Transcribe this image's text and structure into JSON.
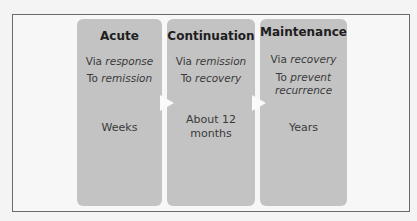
{
  "phases": [
    {
      "title": "Acute",
      "via_prefix": "Via ",
      "via_em": "response",
      "to_prefix": "To ",
      "to_em": "remission",
      "to_em2": "",
      "duration": "Weeks"
    },
    {
      "title": "Continuation",
      "via_prefix": "Via ",
      "via_em": "remission",
      "to_prefix": "To ",
      "to_em": "recovery",
      "to_em2": "",
      "duration": "About 12 months"
    },
    {
      "title": "Maintenance",
      "via_prefix": "Via ",
      "via_em": "recovery",
      "to_prefix": "To ",
      "to_em": "prevent",
      "to_em2": "recurrence",
      "duration": "Years"
    }
  ],
  "colors": {
    "box": "#c3c3c3",
    "arrow": "#fafafa",
    "border": "#6a6a6a"
  }
}
